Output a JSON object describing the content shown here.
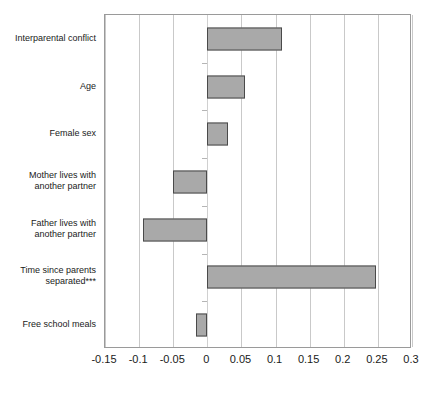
{
  "chart_data": {
    "type": "bar",
    "orientation": "horizontal",
    "title": "",
    "xlabel": "",
    "ylabel": "",
    "xlim": [
      -0.15,
      0.3
    ],
    "xticks": [
      -0.15,
      -0.1,
      -0.05,
      0,
      0.05,
      0.1,
      0.15,
      0.2,
      0.25,
      0.3
    ],
    "xtick_labels": [
      "-0.15",
      "-0.1",
      "-0.05",
      "0",
      "0.05",
      "0.1",
      "0.15",
      "0.2",
      "0.25",
      "0.3"
    ],
    "grid": true,
    "legend": null,
    "categories": [
      "Interparental conflict",
      "Age",
      "Female sex",
      "Mother lives with\nanother partner",
      "Father lives with\nanother partner",
      "Time since parents\nseparated***",
      "Free school meals"
    ],
    "values": [
      0.109,
      0.055,
      0.03,
      -0.05,
      -0.095,
      0.247,
      -0.016
    ],
    "bar_fill_color": "#a9a9a9",
    "bar_border_color": "#4a4a4a",
    "gridline_color": "#c9c9c9",
    "frame_color": "#9a9a9a",
    "background_color": "#ffffff"
  }
}
